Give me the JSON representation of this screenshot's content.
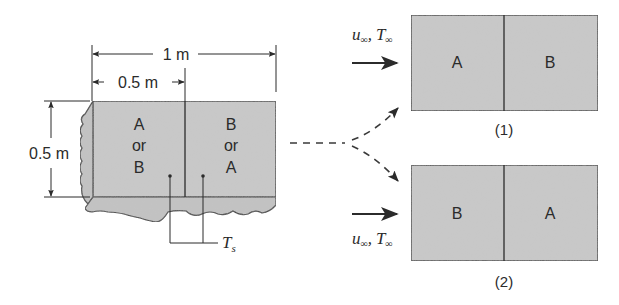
{
  "colors": {
    "fill": "#c9c9c9",
    "fill_dark": "#bdbdbd",
    "stroke": "#2b2b2b",
    "background": "#ffffff"
  },
  "dimensions": {
    "total_length": "1 m",
    "half_length": "0.5 m",
    "height": "0.5 m"
  },
  "source_block": {
    "left_label": [
      "A",
      "or",
      "B"
    ],
    "right_label": [
      "B",
      "or",
      "A"
    ],
    "surface_temp": {
      "symbol": "T",
      "subscript": "s"
    }
  },
  "flow": {
    "velocity": {
      "symbol": "u",
      "subscript": "∞"
    },
    "temperature": {
      "symbol": "T",
      "subscript": "∞"
    },
    "separator": ","
  },
  "configurations": [
    {
      "caption": "(1)",
      "left": "A",
      "right": "B"
    },
    {
      "caption": "(2)",
      "left": "B",
      "right": "A"
    }
  ]
}
